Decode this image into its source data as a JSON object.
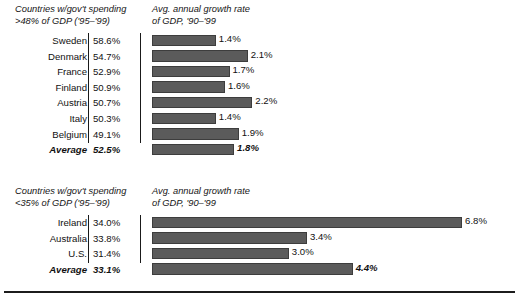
{
  "chart_data": {
    "type": "bar",
    "title": "",
    "xlabel": "",
    "ylabel": "",
    "grid": false,
    "legend": "none",
    "value_axis_unit": "%",
    "panels": [
      {
        "id": "high-spending",
        "left_header": "Countries w/gov't spending\n>48% of GDP ('95–'99)",
        "right_header": "Avg. annual growth rate\nof GDP, '90–'99",
        "categories": [
          "Sweden",
          "Denmark",
          "France",
          "Finland",
          "Austria",
          "Italy",
          "Belgium",
          "Average"
        ],
        "spending_labels": [
          "58.6%",
          "54.7%",
          "52.9%",
          "50.9%",
          "50.7%",
          "50.3%",
          "49.1%",
          "52.5%"
        ],
        "spending_values": [
          58.6,
          54.7,
          52.9,
          50.9,
          50.7,
          50.3,
          49.1,
          52.5
        ],
        "growth_labels": [
          "1.4%",
          "2.1%",
          "1.7%",
          "1.6%",
          "2.2%",
          "1.4%",
          "1.9%",
          "1.8%"
        ],
        "values": [
          1.4,
          2.1,
          1.7,
          1.6,
          2.2,
          1.4,
          1.9,
          1.8
        ],
        "average_row_index": 7
      },
      {
        "id": "low-spending",
        "left_header": "Countries w/gov't spending\n<35% of GDP ('95–'99)",
        "right_header": "Avg. annual growth rate\nof GDP, '90–'99",
        "categories": [
          "Ireland",
          "Australia",
          "U.S.",
          "Average"
        ],
        "spending_labels": [
          "34.0%",
          "33.8%",
          "31.4%",
          "33.1%"
        ],
        "spending_values": [
          34.0,
          33.8,
          31.4,
          33.1
        ],
        "growth_labels": [
          "6.8%",
          "3.4%",
          "3.0%",
          "4.4%"
        ],
        "values": [
          6.8,
          3.4,
          3.0,
          4.4
        ],
        "average_row_index": 3
      }
    ]
  },
  "style": {
    "bar_fill": "#5b5b5b",
    "bar_stroke": "#3d3d3d",
    "text_color": "#111111",
    "rule_color": "#1c1c1c",
    "background": "#ffffff",
    "px_per_percent": 45.6
  }
}
